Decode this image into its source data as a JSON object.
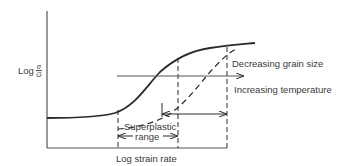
{
  "figure": {
    "type": "schematic plot",
    "y_axis": {
      "label_prefix": "Log",
      "label_numerator": "σ",
      "label_denominator": "G"
    },
    "x_axis": {
      "label": "Log strain rate"
    },
    "curves": [
      {
        "name": "reference",
        "style": "solid"
      },
      {
        "name": "shifted",
        "style": "dashed"
      }
    ],
    "annotations": {
      "decreasing_grain_size": "Decreasing grain size",
      "increasing_temperature": "Increasing temperature",
      "superplastic_line1": "Superplastic",
      "superplastic_line2": "range"
    },
    "colors": {
      "line": "#2a2a2a",
      "text": "#3a3a3a",
      "background": "#ffffff"
    }
  }
}
